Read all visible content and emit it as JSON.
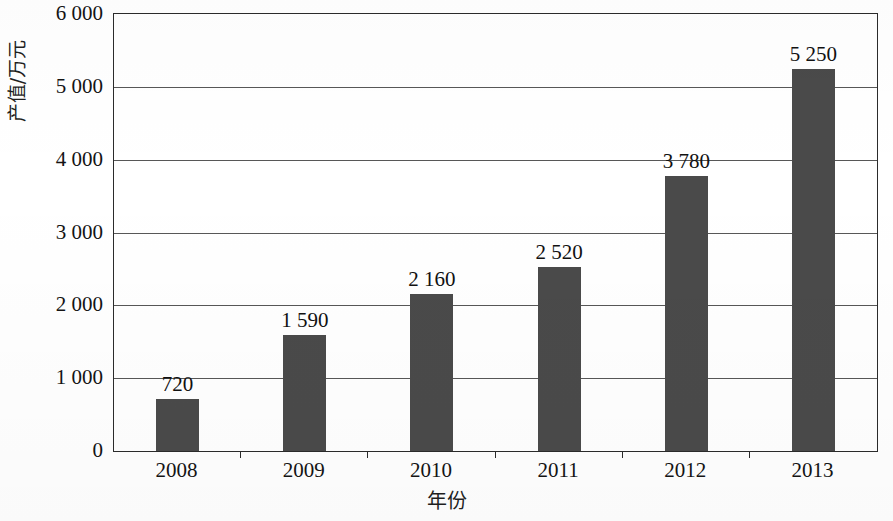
{
  "chart_data": {
    "type": "bar",
    "title": "",
    "xlabel": "年份",
    "ylabel": "产值/万元",
    "categories": [
      "2008",
      "2009",
      "2010",
      "2011",
      "2012",
      "2013"
    ],
    "values": [
      720,
      1590,
      2160,
      2520,
      3780,
      5250
    ],
    "value_labels": [
      "720",
      "1 590",
      "2 160",
      "2 520",
      "3 780",
      "5 250"
    ],
    "ylim": [
      0,
      6000
    ],
    "ytick_values": [
      0,
      1000,
      2000,
      3000,
      4000,
      5000,
      6000
    ],
    "ytick_labels": [
      "0",
      "1 000",
      "2 000",
      "3 000",
      "4 000",
      "5 000",
      "6 000"
    ],
    "grid": true,
    "legend": "none",
    "series": [
      {
        "name": "产值",
        "values": [
          720,
          1590,
          2160,
          2520,
          3780,
          5250
        ]
      }
    ],
    "bar_color": "#4a4a4a",
    "axis_color": "#2b2b2b",
    "grid_color": "#3a3a3a",
    "background_color": "#ffffff"
  }
}
